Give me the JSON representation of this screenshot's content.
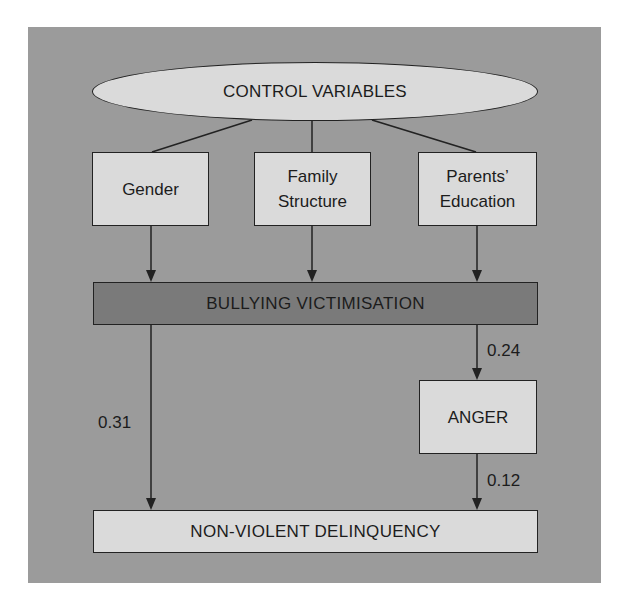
{
  "diagram": {
    "type": "path-model",
    "colors": {
      "panel_background": "#9b9b9b",
      "light_node": "#dadada",
      "dark_node": "#7a7a7a",
      "line": "#222222"
    },
    "nodes": {
      "control_variables": "CONTROL VARIABLES",
      "gender": "Gender",
      "family_structure_line1": "Family",
      "family_structure_line2": "Structure",
      "parents_education_line1": "Parents’",
      "parents_education_line2": "Education",
      "bullying_victimisation": "BULLYING VICTIMISATION",
      "anger": "ANGER",
      "non_violent_delinquency": "NON-VIOLENT DELINQUENCY"
    },
    "edges": [
      {
        "from": "CONTROL VARIABLES",
        "to": "Gender",
        "arrow": false
      },
      {
        "from": "CONTROL VARIABLES",
        "to": "Family Structure",
        "arrow": false
      },
      {
        "from": "CONTROL VARIABLES",
        "to": "Parents’ Education",
        "arrow": false
      },
      {
        "from": "Gender",
        "to": "BULLYING VICTIMISATION",
        "arrow": true
      },
      {
        "from": "Family Structure",
        "to": "BULLYING VICTIMISATION",
        "arrow": true
      },
      {
        "from": "Parents’ Education",
        "to": "BULLYING VICTIMISATION",
        "arrow": true
      },
      {
        "from": "BULLYING VICTIMISATION",
        "to": "ANGER",
        "arrow": true,
        "coefficient": "0.24"
      },
      {
        "from": "BULLYING VICTIMISATION",
        "to": "NON-VIOLENT DELINQUENCY",
        "arrow": true,
        "coefficient": "0.31"
      },
      {
        "from": "ANGER",
        "to": "NON-VIOLENT DELINQUENCY",
        "arrow": true,
        "coefficient": "0.12"
      }
    ],
    "coefficients": {
      "bullying_to_anger": "0.24",
      "bullying_to_delinquency": "0.31",
      "anger_to_delinquency": "0.12"
    }
  }
}
